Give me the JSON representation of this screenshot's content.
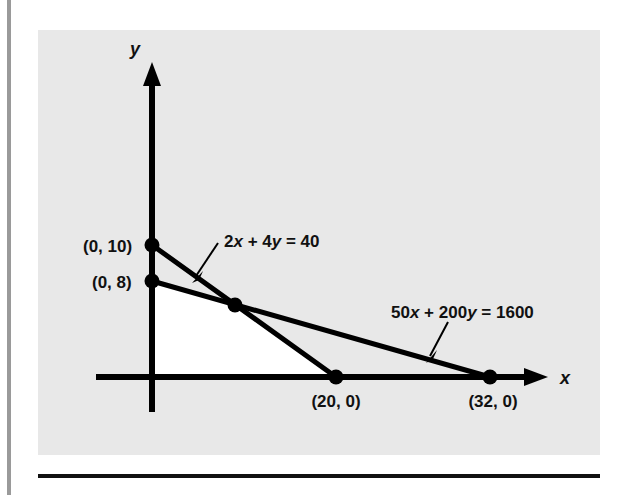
{
  "figure": {
    "panel_bg": "#e8e8e8",
    "page_bg": "#ffffff",
    "ink": "#111111",
    "gutter_bar_color": "#9a9a9a",
    "axis_x_label": "x",
    "axis_y_label": "y"
  },
  "labels": {
    "y_intercept_10": "(0, 10)",
    "y_intercept_8": "(0, 8)",
    "x_intercept_20": "(20, 0)",
    "x_intercept_32": "(32, 0)",
    "line1_equation_prefix": "2",
    "line1_equation": "2x + 4y = 40",
    "line2_equation": "50x + 200y = 1600"
  },
  "chart_data": {
    "type": "line",
    "title": "",
    "xlabel": "x",
    "ylabel": "y",
    "grid": false,
    "legend": "none",
    "xlim": [
      0,
      36
    ],
    "ylim": [
      0,
      12
    ],
    "annotations": [
      {
        "text": "(0, 10)",
        "x": 0,
        "y": 10
      },
      {
        "text": "(0, 8)",
        "x": 0,
        "y": 8
      },
      {
        "text": "(20, 0)",
        "x": 20,
        "y": 0
      },
      {
        "text": "(32, 0)",
        "x": 32,
        "y": 0
      },
      {
        "text": "2x + 4y = 40",
        "points_to_line": "2x + 4y = 40"
      },
      {
        "text": "50x + 200y = 1600",
        "points_to_line": "50x + 200y = 1600"
      }
    ],
    "series": [
      {
        "name": "2x + 4y = 40",
        "equation": "2x + 4y = 40",
        "x": [
          0,
          20
        ],
        "y": [
          10,
          0
        ],
        "intercepts": {
          "y": 10,
          "x": 20
        }
      },
      {
        "name": "50x + 200y = 1600",
        "equation": "50x + 200y = 1600",
        "x": [
          0,
          32
        ],
        "y": [
          8,
          0
        ],
        "intercepts": {
          "y": 8,
          "x": 32
        }
      }
    ],
    "marked_points": [
      {
        "label": "(0, 10)",
        "x": 0,
        "y": 10
      },
      {
        "label": "(0, 8)",
        "x": 0,
        "y": 8
      },
      {
        "label": "",
        "x": 6.67,
        "y": 6.67
      },
      {
        "label": "(20, 0)",
        "x": 20,
        "y": 0
      },
      {
        "label": "(32, 0)",
        "x": 32,
        "y": 0
      }
    ],
    "shaded_region": {
      "description": "feasible region (white)",
      "vertices": [
        [
          0,
          0
        ],
        [
          0,
          8
        ],
        [
          6.67,
          6.67
        ],
        [
          20,
          0
        ]
      ],
      "fill": "#ffffff"
    }
  }
}
